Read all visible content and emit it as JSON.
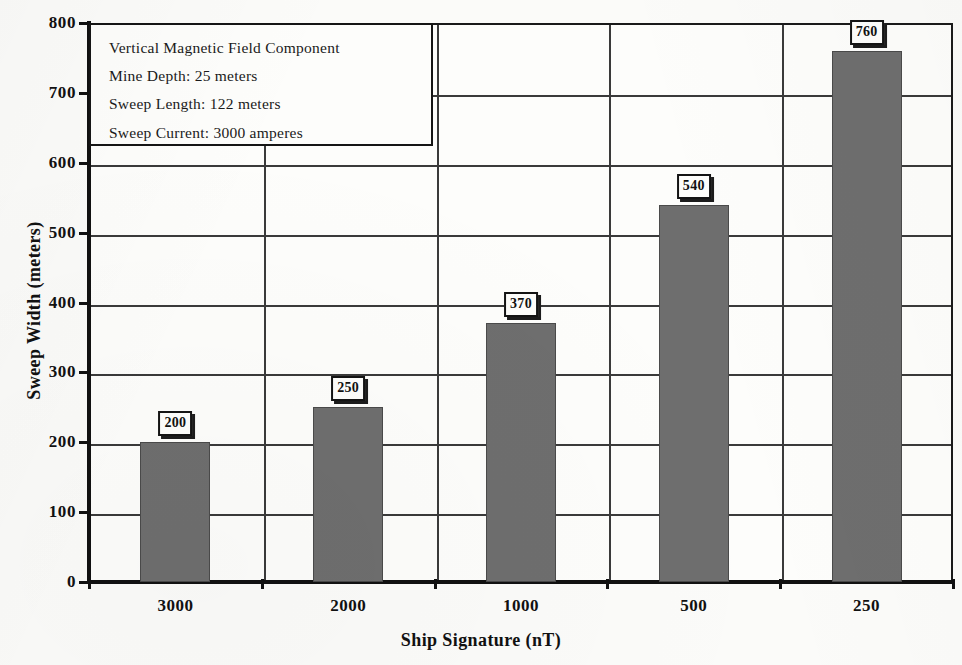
{
  "chart_data": {
    "type": "bar",
    "title": "",
    "categories": [
      "3000",
      "2000",
      "1000",
      "500",
      "250"
    ],
    "values": [
      200,
      250,
      370,
      540,
      760
    ],
    "data_labels": [
      "200",
      "250",
      "370",
      "540",
      "760"
    ],
    "xlabel": "Ship Signature (nT)",
    "ylabel": "Sweep Width (meters)",
    "ylim": [
      0,
      800
    ],
    "yticks": [
      0,
      100,
      200,
      300,
      400,
      500,
      600,
      700,
      800
    ],
    "ytick_labels": [
      "0",
      "100",
      "200",
      "300",
      "400",
      "500",
      "600",
      "700",
      "800"
    ],
    "grid": "both",
    "legend_position": "none",
    "bar_color": "#6e6e6e",
    "axis_color": "#111111",
    "grid_color": "#3a3a3a",
    "background_color": "#fbfbf9"
  },
  "annotation": {
    "lines": [
      "Vertical Magnetic Field Component",
      "Mine Depth: 25 meters",
      "Sweep Length: 122 meters",
      "Sweep Current: 3000 amperes"
    ]
  }
}
